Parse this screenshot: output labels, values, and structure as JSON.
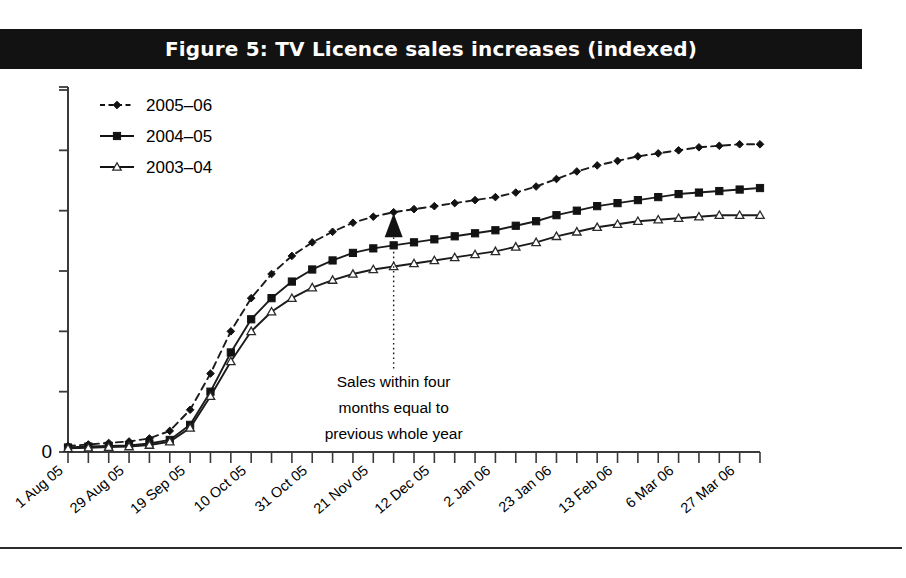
{
  "figure": {
    "title": "Figure 5: TV Licence sales increases (indexed)",
    "banner_color": "#121212",
    "banner_text_color": "#ffffff"
  },
  "annotation": {
    "line1": "Sales within four",
    "line2": "months equal to",
    "line3": "previous whole year"
  },
  "legend": {
    "position": "top-left inside plot",
    "items": [
      {
        "label": "2005–06",
        "marker": "diamond",
        "style": "dashed"
      },
      {
        "label": "2004–05",
        "marker": "square",
        "style": "solid"
      },
      {
        "label": "2003–04",
        "marker": "triangle",
        "style": "solid"
      }
    ]
  },
  "axis": {
    "y_tick_labels": [
      "0"
    ],
    "y_label": "",
    "x_label": ""
  },
  "chart_data": {
    "type": "line",
    "title": "Figure 5: TV Licence sales increases (indexed)",
    "subtitle": "",
    "xlabel": "",
    "ylabel": "",
    "grid": false,
    "legend_position": "top-left",
    "ylim": [
      0,
      120
    ],
    "yticks": [
      0,
      20,
      40,
      60,
      80,
      100,
      120
    ],
    "ytick_labels": [
      "0",
      "",
      "",
      "",
      "",
      "",
      ""
    ],
    "x_tick_labels": [
      "1 Aug 05",
      "29 Aug 05",
      "19 Sep 05",
      "10 Oct 05",
      "31 Oct 05",
      "21 Nov 05",
      "12 Dec 05",
      "2 Jan 06",
      "23 Jan 06",
      "13 Feb 06",
      "6 Mar 06",
      "27 Mar 06"
    ],
    "x_tick_label_every": 3,
    "x": [
      "1 Aug 05",
      "8 Aug 05",
      "15 Aug 05",
      "22 Aug 05",
      "29 Aug 05",
      "5 Sep 05",
      "12 Sep 05",
      "19 Sep 05",
      "26 Sep 05",
      "3 Oct 05",
      "10 Oct 05",
      "17 Oct 05",
      "24 Oct 05",
      "31 Oct 05",
      "7 Nov 05",
      "14 Nov 05",
      "21 Nov 05",
      "28 Nov 05",
      "5 Dec 05",
      "12 Dec 05",
      "19 Dec 05",
      "26 Dec 05",
      "2 Jan 06",
      "9 Jan 06",
      "16 Jan 06",
      "23 Jan 06",
      "30 Jan 06",
      "6 Feb 06",
      "13 Feb 06",
      "20 Feb 06",
      "27 Feb 06",
      "6 Mar 06",
      "13 Mar 06",
      "20 Mar 06",
      "27 Mar 06"
    ],
    "series": [
      {
        "name": "2005–06",
        "marker": "diamond",
        "style": "dashed",
        "values": [
          2,
          2.5,
          3,
          3.5,
          4.5,
          7,
          14,
          26,
          40,
          51,
          59,
          65,
          69.5,
          73,
          76,
          78,
          79.5,
          80.5,
          81.5,
          82.5,
          83.5,
          84.5,
          86,
          88,
          90.5,
          93,
          95,
          96.5,
          98,
          99,
          100,
          101,
          101.5,
          102,
          102
        ]
      },
      {
        "name": "2004–05",
        "marker": "square",
        "style": "solid",
        "values": [
          1.5,
          1.8,
          2,
          2.2,
          2.8,
          4,
          9,
          20,
          33,
          44,
          51,
          56.5,
          60.5,
          63.5,
          66,
          67.5,
          68.5,
          69.5,
          70.5,
          71.5,
          72.5,
          73.5,
          75,
          76.5,
          78.5,
          80,
          81.5,
          82.5,
          83.5,
          84.5,
          85.5,
          86,
          86.5,
          87,
          87.5
        ]
      },
      {
        "name": "2003–04",
        "marker": "triangle",
        "style": "solid",
        "values": [
          1.2,
          1.4,
          1.6,
          1.8,
          2.3,
          3.4,
          8,
          18.5,
          30,
          40,
          46.5,
          51,
          54.5,
          57,
          59,
          60.5,
          61.5,
          62.5,
          63.5,
          64.5,
          65.5,
          66.5,
          68,
          69.5,
          71.5,
          73,
          74.5,
          75.5,
          76.5,
          77,
          77.5,
          78,
          78.5,
          78.5,
          78.5
        ]
      }
    ],
    "annotations": [
      {
        "text": "Sales within four months equal to previous whole year",
        "at_x": "21 Nov 05",
        "points_to_series": "2005–06"
      }
    ]
  }
}
